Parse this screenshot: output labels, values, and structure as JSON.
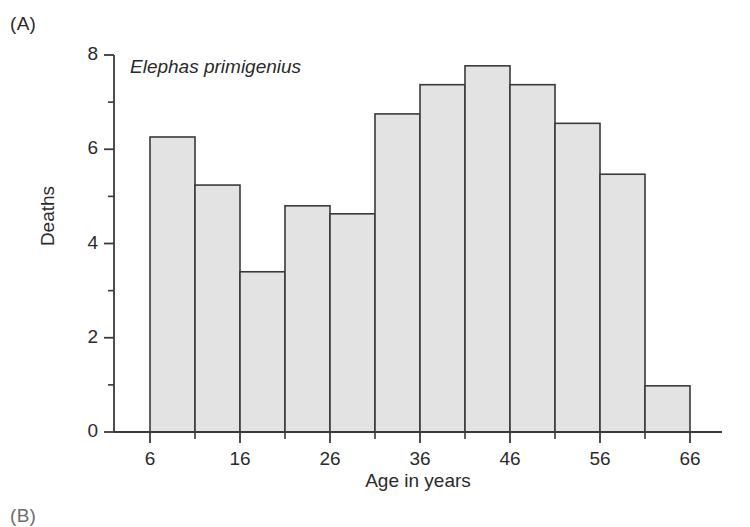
{
  "figure": {
    "panel_letter": "(A)",
    "next_panel_letter": "(B)"
  },
  "chart_data": {
    "type": "bar",
    "title": "Elephas primigenius",
    "title_style": "italic",
    "xlabel": "Age in years",
    "ylabel": "Deaths",
    "categories": [
      "6-11",
      "11-16",
      "16-21",
      "21-26",
      "26-31",
      "31-36",
      "36-41",
      "41-46",
      "46-51",
      "51-56",
      "56-61",
      "61-66"
    ],
    "bin_edges": [
      6,
      11,
      16,
      21,
      26,
      31,
      36,
      41,
      46,
      51,
      56,
      61,
      66
    ],
    "bin_width": 5,
    "values": [
      6.26,
      5.24,
      3.4,
      4.8,
      4.63,
      6.75,
      7.37,
      7.77,
      7.37,
      6.55,
      5.47,
      0.98
    ],
    "xlim": [
      6,
      66
    ],
    "ylim": [
      0,
      8
    ],
    "x_major_ticks": [
      6,
      16,
      26,
      36,
      46,
      56,
      66
    ],
    "x_minor_ticks": [
      11,
      21,
      31,
      41,
      51,
      61
    ],
    "x_tick_labels": [
      "6",
      "16",
      "26",
      "36",
      "46",
      "56",
      "66"
    ],
    "y_major_ticks": [
      0,
      2,
      4,
      6,
      8
    ],
    "y_minor_ticks": [
      1,
      3,
      5,
      7
    ],
    "y_tick_labels": [
      "0",
      "2",
      "4",
      "6",
      "8"
    ],
    "grid": false,
    "legend": null,
    "bar_fill_color": "#e3e3e3",
    "bar_edge_color": "#3a3a3a",
    "axis_color": "#3a3a3a"
  }
}
